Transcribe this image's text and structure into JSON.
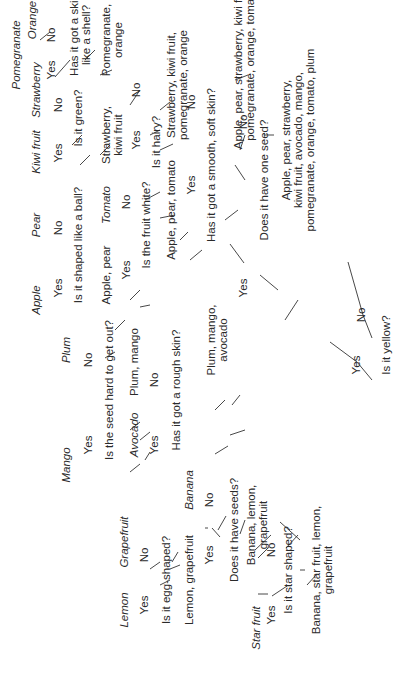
{
  "diagram": {
    "type": "decision-tree",
    "orientation": "rotated -90deg (reads bottom-to-top)",
    "root": {
      "question": "Is it yellow?",
      "yes": {
        "set": "Banana, star fruit, lemon, grapefruit",
        "question": "Is it star shaped?",
        "yes": {
          "leaf": "Star fruit"
        },
        "no": {
          "set": "Banana, lemon, grapefruit",
          "question": "Does it have seeds?",
          "yes": {
            "set": "Lemon, grapefruit",
            "question": "Is it egg-shaped?",
            "yes": {
              "leaf": "Lemon"
            },
            "no": {
              "leaf": "Grapefruit"
            }
          },
          "no": {
            "leaf": "Banana"
          }
        }
      },
      "no": {
        "set": "Apple, pear, strawberry, kiwi fruit, avocado, mango, pomegranate, orange, tomato, plum",
        "question": "Does it have one seed?",
        "yes": {
          "set": "Plum, mango, avocado",
          "question": "Has it got a rough skin?",
          "yes": {
            "leaf": "Avocado"
          },
          "no": {
            "set": "Plum, mango",
            "question": "Is the seed hard to get out?",
            "yes": {
              "leaf": "Mango"
            },
            "no": {
              "leaf": "Plum"
            }
          }
        },
        "no": {
          "set": "Apple, pear, strawberry, kiwi fruit, pomegranate, orange, tomato",
          "question": "Has it got a smooth, soft skin?",
          "yes": {
            "set": "Apple, pear, tomato",
            "question": "Is the fruit white?",
            "yes": {
              "set": "Apple, pear",
              "question": "Is it shaped like a ball?",
              "yes": {
                "leaf": "Apple"
              },
              "no": {
                "leaf": "Pear"
              }
            },
            "no": {
              "leaf": "Tomato"
            }
          },
          "no": {
            "set": "Strawberry, kiwi fruit, pomegranate, orange",
            "question": "Is it hairy?",
            "yes": {
              "set": "Strawberry, kiwi fruit",
              "question": "Is it green?",
              "yes": {
                "leaf": "Kiwi fruit"
              },
              "no": {
                "leaf": "Strawberry"
              }
            },
            "no": {
              "set": "Pomegranate, orange",
              "question": "Has it got a skin like a shell?",
              "yes": {
                "leaf": "Pomegranate"
              },
              "no": {
                "leaf": "Orange"
              }
            }
          }
        }
      }
    }
  },
  "labels": {
    "yes": "Yes",
    "no": "No",
    "q_yellow": "Is it yellow?",
    "set_yellow_yes_1": "Banana, star fruit, lemon,",
    "set_yellow_yes_2": "grapefruit",
    "q_star": "Is it star shaped?",
    "leaf_starfruit": "Star fruit",
    "set_blg_1": "Banana, lemon,",
    "set_blg_2": "grapefruit",
    "q_seeds": "Does it have seeds?",
    "leaf_banana": "Banana",
    "set_lg": "Lemon, grapefruit",
    "q_egg": "Is it egg-shaped?",
    "leaf_lemon": "Lemon",
    "leaf_grapefruit": "Grapefruit",
    "set_all_1": "Apple, pear, strawberry,",
    "set_all_2": "kiwi fruit, avocado, mango,",
    "set_all_3": "pomegranate, orange, tomato, plum",
    "q_oneseed": "Does it have one seed?",
    "set_pma_1": "Plum, mango,",
    "set_pma_2": "avocado",
    "q_rough": "Has it got a rough skin?",
    "leaf_avocado": "Avocado",
    "set_pm": "Plum, mango",
    "q_hardseed": "Is the seed hard to get out?",
    "leaf_mango": "Mango",
    "leaf_plum": "Plum",
    "set_multi_1": "Apple, pear, strawberry, kiwi fruit,",
    "set_multi_2": "pomegranate, orange, tomato",
    "q_smooth": "Has it got a smooth, soft skin?",
    "set_apt": "Apple, pear, tomato",
    "q_white": "Is the fruit white?",
    "leaf_tomato": "Tomato",
    "set_ap": "Apple, pear",
    "q_ball": "Is it shaped like a ball?",
    "leaf_apple": "Apple",
    "leaf_pear": "Pear",
    "set_skpo_1": "Strawberry, kiwi fruit,",
    "set_skpo_2": "pomegranate, orange",
    "q_hairy": "Is it hairy?",
    "set_sk_1": "Strawberry,",
    "set_sk_2": "kiwi fruit",
    "q_green": "Is it green?",
    "leaf_kiwi": "Kiwi fruit",
    "leaf_strawberry": "Strawberry",
    "set_po_1": "Pomegranate,",
    "set_po_2": "orange",
    "q_shell_1": "Has it got a skin",
    "q_shell_2": "like a shell?",
    "leaf_pomegranate": "Pomegranate",
    "leaf_orange": "Orange"
  }
}
